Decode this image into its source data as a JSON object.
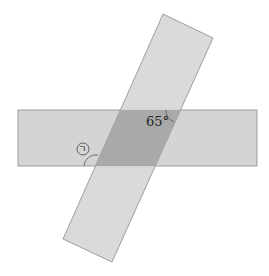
{
  "diagram": {
    "angle_label": "65°",
    "unknown_angle_label": "ㄱ",
    "colors": {
      "strip": "#d4d4d4",
      "overlap": "#a9a9a9",
      "edge": "#8a8a8a",
      "background": "#ffffff"
    }
  }
}
